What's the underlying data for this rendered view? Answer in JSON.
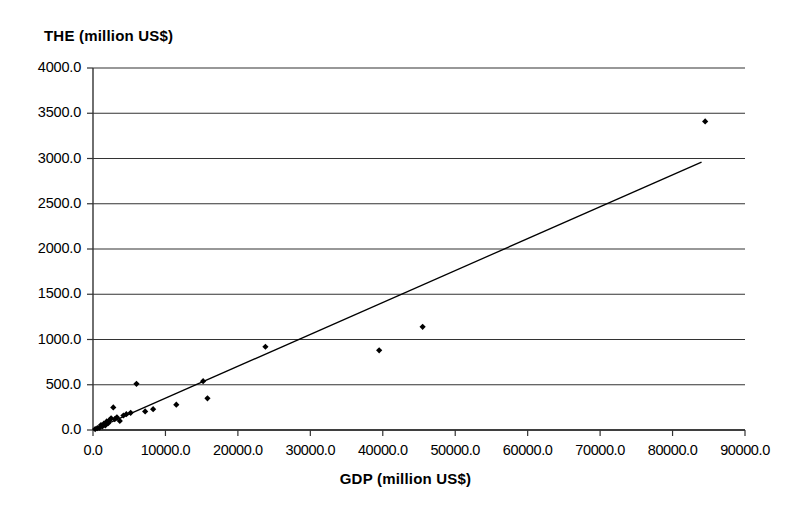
{
  "chart_data": {
    "type": "scatter",
    "title": "THE (million US$)",
    "xlabel": "GDP (million US$)",
    "ylabel": "THE (million US$)",
    "xlim": [
      0,
      90000
    ],
    "ylim": [
      0,
      4000
    ],
    "grid": "horizontal",
    "legend": "none",
    "xticks": [
      0,
      10000,
      20000,
      30000,
      40000,
      50000,
      60000,
      70000,
      80000,
      90000
    ],
    "xtick_labels": [
      "0.0",
      "10000.0",
      "20000.0",
      "30000.0",
      "40000.0",
      "50000.0",
      "60000.0",
      "70000.0",
      "80000.0",
      "90000.0"
    ],
    "yticks": [
      0,
      500,
      1000,
      1500,
      2000,
      2500,
      3000,
      3500,
      4000
    ],
    "ytick_labels": [
      "0.0",
      "500.0",
      "1000.0",
      "1500.0",
      "2000.0",
      "2500.0",
      "3000.0",
      "3500.0",
      "4000.0"
    ],
    "marker": "filled-diamond",
    "marker_color": "#000000",
    "series": [
      {
        "name": "THE vs GDP",
        "points": [
          [
            300,
            10
          ],
          [
            600,
            20
          ],
          [
            900,
            25
          ],
          [
            1100,
            55
          ],
          [
            1300,
            40
          ],
          [
            1500,
            70
          ],
          [
            1700,
            50
          ],
          [
            1900,
            95
          ],
          [
            2100,
            75
          ],
          [
            2300,
            110
          ],
          [
            2500,
            130
          ],
          [
            2800,
            250
          ],
          [
            3000,
            120
          ],
          [
            3300,
            140
          ],
          [
            3700,
            100
          ],
          [
            4200,
            160
          ],
          [
            4600,
            175
          ],
          [
            5200,
            190
          ],
          [
            6000,
            510
          ],
          [
            7200,
            205
          ],
          [
            8300,
            230
          ],
          [
            11500,
            280
          ],
          [
            15200,
            540
          ],
          [
            15800,
            350
          ],
          [
            23800,
            920
          ],
          [
            39500,
            880
          ],
          [
            45500,
            1140
          ],
          [
            84500,
            3410
          ]
        ]
      }
    ],
    "trendline": {
      "type": "linear-fit",
      "x_start": 300,
      "y_start": 10,
      "x_end": 84000,
      "y_end": 2960,
      "color": "#000000"
    }
  }
}
